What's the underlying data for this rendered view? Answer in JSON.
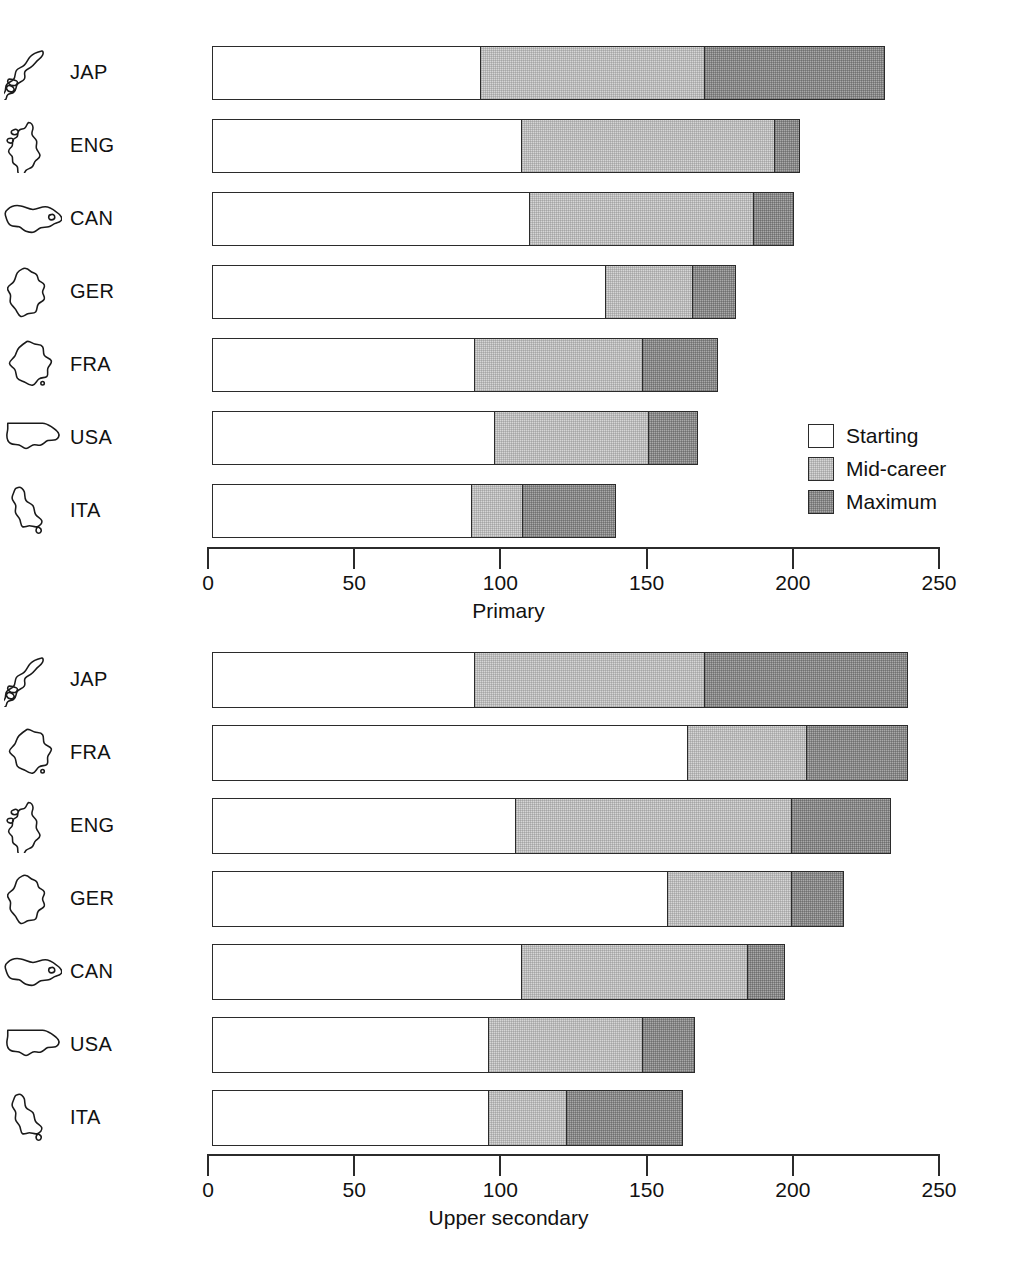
{
  "chart_data": [
    {
      "type": "bar",
      "orientation": "horizontal",
      "stacked": true,
      "title": "",
      "xlabel": "Primary",
      "ylabel": "",
      "xlim": [
        0,
        250
      ],
      "xticks": [
        0,
        50,
        100,
        150,
        200,
        250
      ],
      "xtick_labels": [
        "0",
        "50",
        "100",
        "150",
        "200",
        "250"
      ],
      "grid": false,
      "categories": [
        "JAP",
        "ENG",
        "CAN",
        "GER",
        "FRA",
        "USA",
        "ITA"
      ],
      "series": [
        {
          "name": "Starting",
          "values": [
            92,
            106,
            109,
            135,
            90,
            97,
            89
          ]
        },
        {
          "name": "Mid-career",
          "values": [
            169,
            193,
            186,
            165,
            148,
            150,
            107
          ]
        },
        {
          "name": "Maximum",
          "values": [
            231,
            202,
            200,
            180,
            174,
            167,
            139
          ]
        }
      ],
      "note": "series values are cumulative stack edge positions on the x axis"
    },
    {
      "type": "bar",
      "orientation": "horizontal",
      "stacked": true,
      "title": "",
      "xlabel": "Upper secondary",
      "ylabel": "",
      "xlim": [
        0,
        250
      ],
      "xticks": [
        0,
        50,
        100,
        150,
        200,
        250
      ],
      "xtick_labels": [
        "0",
        "50",
        "100",
        "150",
        "200",
        "250"
      ],
      "grid": false,
      "categories": [
        "JAP",
        "FRA",
        "ENG",
        "GER",
        "CAN",
        "USA",
        "ITA"
      ],
      "series": [
        {
          "name": "Starting",
          "values": [
            90,
            163,
            104,
            156,
            106,
            95,
            95
          ]
        },
        {
          "name": "Mid-career",
          "values": [
            169,
            204,
            199,
            199,
            184,
            148,
            122
          ]
        },
        {
          "name": "Maximum",
          "values": [
            239,
            239,
            233,
            217,
            197,
            166,
            162
          ]
        }
      ],
      "note": "series values are cumulative stack edge positions on the x axis"
    }
  ],
  "legend": {
    "position": "inside-right",
    "items": [
      {
        "label": "Starting",
        "color": "#ffffff",
        "key": "starting"
      },
      {
        "label": "Mid-career",
        "color": "#d6d6d6",
        "key": "mid"
      },
      {
        "label": "Maximum",
        "color": "#a9a9a9",
        "key": "max"
      }
    ]
  },
  "panels": [
    {
      "id": "primary",
      "axis_title": "Primary",
      "rows": [
        {
          "code": "JAP",
          "flag": "japan-outline-icon",
          "starting": 92,
          "mid": 169,
          "max": 231
        },
        {
          "code": "ENG",
          "flag": "united-kingdom-outline-icon",
          "starting": 106,
          "mid": 193,
          "max": 202
        },
        {
          "code": "CAN",
          "flag": "canada-outline-icon",
          "starting": 109,
          "mid": 186,
          "max": 200
        },
        {
          "code": "GER",
          "flag": "germany-outline-icon",
          "starting": 135,
          "mid": 165,
          "max": 180
        },
        {
          "code": "FRA",
          "flag": "france-outline-icon",
          "starting": 90,
          "mid": 148,
          "max": 174
        },
        {
          "code": "USA",
          "flag": "united-states-outline-icon",
          "starting": 97,
          "mid": 150,
          "max": 167
        },
        {
          "code": "ITA",
          "flag": "italy-outline-icon",
          "starting": 89,
          "mid": 107,
          "max": 139
        }
      ]
    },
    {
      "id": "upper-secondary",
      "axis_title": "Upper secondary",
      "rows": [
        {
          "code": "JAP",
          "flag": "japan-outline-icon",
          "starting": 90,
          "mid": 169,
          "max": 239
        },
        {
          "code": "FRA",
          "flag": "france-outline-icon",
          "starting": 163,
          "mid": 204,
          "max": 239
        },
        {
          "code": "ENG",
          "flag": "united-kingdom-outline-icon",
          "starting": 104,
          "mid": 199,
          "max": 233
        },
        {
          "code": "GER",
          "flag": "germany-outline-icon",
          "starting": 156,
          "mid": 199,
          "max": 217
        },
        {
          "code": "CAN",
          "flag": "canada-outline-icon",
          "starting": 106,
          "mid": 184,
          "max": 197
        },
        {
          "code": "USA",
          "flag": "united-states-outline-icon",
          "starting": 95,
          "mid": 148,
          "max": 166
        },
        {
          "code": "ITA",
          "flag": "italy-outline-icon",
          "starting": 95,
          "mid": 122,
          "max": 162
        }
      ]
    }
  ],
  "axis": {
    "ticks": [
      "0",
      "50",
      "100",
      "150",
      "200",
      "250"
    ],
    "min": 0,
    "max": 250
  }
}
